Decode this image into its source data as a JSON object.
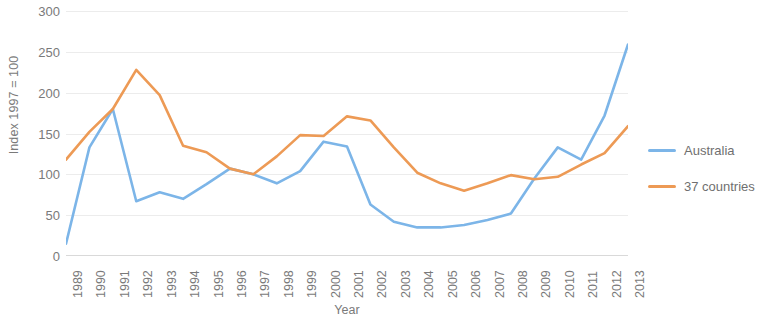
{
  "chart_data": {
    "type": "line",
    "title": "",
    "xlabel": "Year",
    "ylabel": "Index 1997 = 100",
    "ylim": [
      0,
      300
    ],
    "yticks": [
      0,
      50,
      100,
      150,
      200,
      250,
      300
    ],
    "grid": true,
    "legend_position": "right",
    "categories": [
      "1989",
      "1990",
      "1991",
      "1992",
      "1993",
      "1994",
      "1995",
      "1996",
      "1997",
      "1998",
      "1999",
      "2000",
      "2001",
      "2002",
      "2003",
      "2004",
      "2005",
      "2006",
      "2007",
      "2008",
      "2009",
      "2010",
      "2011",
      "2012",
      "2013"
    ],
    "series": [
      {
        "name": "Australia",
        "color": "#7CB5E8",
        "values": [
          15,
          133,
          180,
          67,
          78,
          70,
          88,
          107,
          100,
          89,
          104,
          140,
          134,
          63,
          42,
          35,
          35,
          38,
          44,
          52,
          95,
          133,
          118,
          172,
          259
        ]
      },
      {
        "name": "37 countries",
        "color": "#ED9A55",
        "values": [
          118,
          152,
          180,
          228,
          197,
          135,
          127,
          107,
          100,
          122,
          148,
          147,
          171,
          166,
          133,
          102,
          89,
          80,
          89,
          99,
          94,
          97,
          112,
          126,
          159
        ]
      }
    ]
  },
  "legend": {
    "items": [
      {
        "label": "Australia",
        "color": "#7CB5E8"
      },
      {
        "label": "37 countries",
        "color": "#ED9A55"
      }
    ]
  },
  "colors": {
    "australia": "#7CB5E8",
    "countries_37": "#ED9A55",
    "gridline": "#ececec",
    "text": "#7a7a7a"
  }
}
